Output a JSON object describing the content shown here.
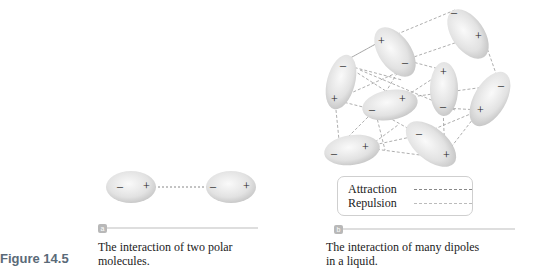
{
  "figure": {
    "label": "Figure 14.5"
  },
  "panel_a": {
    "tag": "a",
    "caption_line1": "The interaction of two polar",
    "caption_line2": "molecules.",
    "molecules": [
      {
        "neg": "–",
        "pos": "+"
      },
      {
        "neg": "–",
        "pos": "+"
      }
    ]
  },
  "panel_b": {
    "tag": "b",
    "caption_line1": "The interaction of many dipoles",
    "caption_line2": "in a liquid.",
    "legend": {
      "attraction": "Attraction",
      "repulsion": "Repulsion"
    },
    "charges": {
      "neg": "–",
      "pos": "+"
    }
  },
  "colors": {
    "ellipse_fill": "#e4e4e4",
    "dash_line": "#8a8a8a",
    "figure_label": "#5a6a78"
  }
}
